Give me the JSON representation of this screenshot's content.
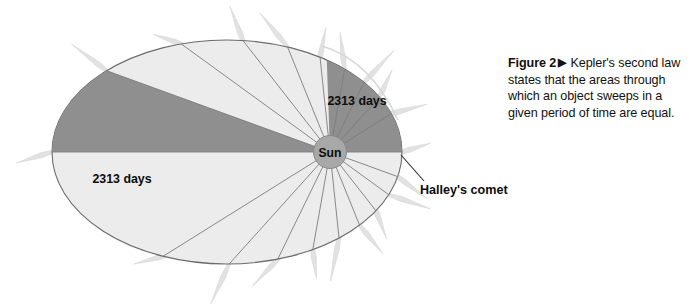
{
  "figure": {
    "caption_lead": "Figure 2",
    "caption_marker": "▶",
    "caption_body": "Kepler's second law states that the areas through which an object sweeps in a given period of time are equal."
  },
  "diagram": {
    "sun_label": "Sun",
    "comet_label": "Halley's comet",
    "sector_upper_label": "2313 days",
    "sector_left_label": "2313 days",
    "colors": {
      "orbit_fill": "#ececec",
      "sector_fill": "#8f8f8f",
      "sun_fill": "#a8a8a8",
      "outline": "#6b6b6b",
      "spoke": "#7d7d7d",
      "comet_tail": "#e2e2e2",
      "text": "#0d0d0d"
    }
  },
  "chart_data": {
    "type": "diagram",
    "ellipse": {
      "center_x": 227,
      "center_y": 152,
      "semi_major": 175,
      "semi_minor": 112
    },
    "sun": {
      "x": 330,
      "y": 152,
      "radius": 16,
      "label": "Sun"
    },
    "swept_sectors": [
      {
        "name": "upper-right-sector",
        "label": "2313 days",
        "start_angle_deg": -92,
        "end_angle_deg": 0,
        "label_x": 357,
        "label_y": 100
      },
      {
        "name": "left-sector",
        "label": "2313 days",
        "start_angle_deg": 180,
        "end_angle_deg": 200,
        "label_x": 122,
        "label_y": 179
      }
    ],
    "spoke_angles_deg": [
      0,
      20,
      36,
      52,
      68,
      84,
      100,
      116,
      132,
      148,
      180,
      200,
      216,
      232,
      248,
      264,
      280,
      296,
      312,
      328
    ],
    "annotations": [
      {
        "text": "Halley's comet",
        "x": 425,
        "y": 190,
        "leader_to_x": 399,
        "leader_to_y": 156
      }
    ]
  }
}
